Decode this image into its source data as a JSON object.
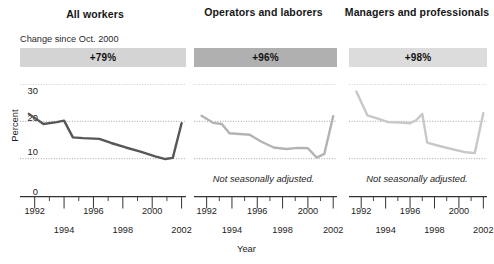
{
  "figure": {
    "xlabel": "Year",
    "note": "Not seasonally adjusted."
  },
  "chart_data": {
    "type": "line",
    "title": "",
    "xlabel": "Year",
    "ylabel": "Percent",
    "xlim": [
      1991.0,
      2002.3
    ],
    "ylim": [
      0,
      30
    ],
    "yticks": [
      0,
      10,
      20,
      30
    ],
    "ytick_labels": [
      "0",
      "10",
      "20",
      "30"
    ],
    "xticks": [
      1992,
      1993,
      1994,
      1995,
      1996,
      1997,
      1998,
      1999,
      2000,
      2001,
      2002
    ],
    "xtick_labels_row_a": [
      "1992",
      "1996",
      "2000"
    ],
    "xtick_labels_row_b": [
      "1994",
      "1998",
      "2002"
    ],
    "grid": "horizontal dotted at 10, 20, 30",
    "legend": "none",
    "panels": [
      {
        "name": "All workers",
        "title": "All workers",
        "subnote": "Change since Oct. 2000",
        "banner_label": "+79%",
        "banner_color": "#d4d4d4",
        "line_color": "#575757",
        "show_yaxis": true,
        "note": "",
        "x": [
          1991.6,
          1992.6,
          1993.5,
          1994.0,
          1994.6,
          1995.3,
          1996.4,
          1997.2,
          1998.2,
          1999.2,
          2000.2,
          2000.9,
          2001.4,
          2002.0
        ],
        "values": [
          22.0,
          19.3,
          19.8,
          20.2,
          15.7,
          15.5,
          15.3,
          14.2,
          13.0,
          11.9,
          10.6,
          9.9,
          10.2,
          19.5
        ]
      },
      {
        "name": "Operators and laborers",
        "title": "Operators and laborers",
        "subnote": "",
        "banner_label": "+96%",
        "banner_color": "#b0b0b0",
        "line_color": "#b3b3b3",
        "show_yaxis": false,
        "note": "Not seasonally adjusted.",
        "x": [
          1991.6,
          1992.5,
          1993.2,
          1993.8,
          1994.6,
          1995.4,
          1996.3,
          1997.3,
          1998.3,
          1999.2,
          2000.0,
          2000.7,
          2001.3,
          2002.0
        ],
        "values": [
          21.5,
          19.6,
          19.3,
          16.8,
          16.6,
          16.4,
          14.6,
          13.0,
          12.6,
          12.9,
          12.8,
          10.3,
          11.3,
          21.4
        ]
      },
      {
        "name": "Managers and professionals",
        "title": "Managers and professionals",
        "subnote": "",
        "banner_label": "+98%",
        "banner_color": "#dcdcdc",
        "line_color": "#c8c8c8",
        "show_yaxis": false,
        "note": "Not seasonally adjusted.",
        "x": [
          1991.6,
          1992.5,
          1993.3,
          1994.2,
          1995.2,
          1996.0,
          1996.5,
          1997.0,
          1997.4,
          1998.4,
          1999.4,
          2000.4,
          2001.3,
          2002.0
        ],
        "values": [
          28.0,
          21.6,
          20.8,
          19.8,
          19.7,
          19.5,
          20.3,
          22.0,
          14.3,
          13.4,
          12.6,
          11.8,
          11.5,
          22.2
        ]
      }
    ]
  }
}
